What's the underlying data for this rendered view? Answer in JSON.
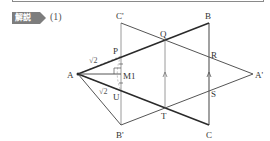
{
  "header": {
    "badge_label": "解説",
    "part_label": "(1)"
  },
  "figure": {
    "points": {
      "C_prime": {
        "label": "C'",
        "x": 121,
        "y": 23
      },
      "B": {
        "label": "B",
        "x": 209,
        "y": 23
      },
      "B_prime": {
        "label": "B'",
        "x": 121,
        "y": 125
      },
      "C": {
        "label": "C",
        "x": 209,
        "y": 125
      },
      "A": {
        "label": "A",
        "x": 78,
        "y": 74
      },
      "A_prime": {
        "label": "A'",
        "x": 253,
        "y": 74
      },
      "P": {
        "label": "P",
        "x": 121,
        "y": 56
      },
      "Q": {
        "label": "Q",
        "x": 165,
        "y": 40
      },
      "R": {
        "label": "R",
        "x": 209,
        "y": 58
      },
      "S": {
        "label": "S",
        "x": 209,
        "y": 89
      },
      "T": {
        "label": "T",
        "x": 165,
        "y": 108
      },
      "U": {
        "label": "U",
        "x": 121,
        "y": 91
      },
      "M": {
        "label": "M",
        "x": 121,
        "y": 74
      }
    },
    "annotations": {
      "sqrt2_upper": "√2",
      "sqrt2_lower": "√2",
      "m_label": "M1"
    },
    "colors": {
      "thick_line": "#2a2a2a",
      "thin_line": "#555555",
      "gray_line": "#9a9a9a",
      "dashed": "#9a9a9a"
    }
  }
}
